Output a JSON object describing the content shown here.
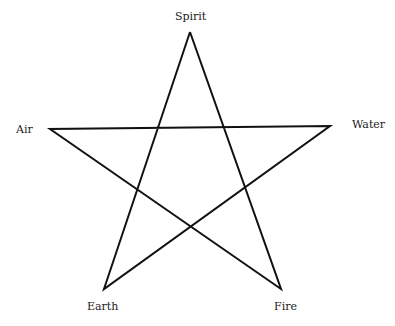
{
  "diagram": {
    "type": "pentagram",
    "stroke_color": "#111111",
    "stroke_width": 2,
    "vertices": {
      "spirit": {
        "x": 190,
        "y": 32
      },
      "water": {
        "x": 330,
        "y": 126
      },
      "fire": {
        "x": 281,
        "y": 289
      },
      "earth": {
        "x": 104,
        "y": 289
      },
      "air": {
        "x": 50,
        "y": 129
      }
    },
    "path_order": [
      "spirit",
      "fire",
      "air",
      "water",
      "earth",
      "spirit"
    ],
    "labels": {
      "spirit": "Spirit",
      "water": "Water",
      "fire": "Fire",
      "earth": "Earth",
      "air": "Air"
    }
  }
}
